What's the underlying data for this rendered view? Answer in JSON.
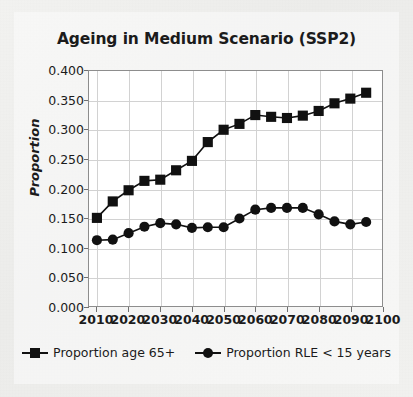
{
  "figure": {
    "title": "Ageing in Medium Scenario (SSP2)",
    "ylabel": "Proportion"
  },
  "legend": {
    "items": [
      {
        "label": "Proportion age 65+",
        "marker": "square-marker-icon",
        "color": "#111111"
      },
      {
        "label": "Proportion RLE < 15 years",
        "marker": "circle-marker-icon",
        "color": "#111111"
      }
    ]
  },
  "axes": {
    "yticks": [
      "0.400",
      "0.350",
      "0.300",
      "0.250",
      "0.200",
      "0.150",
      "0.100",
      "0.050",
      "0.000"
    ],
    "xticks": [
      "2010",
      "2020",
      "2030",
      "2040",
      "2050",
      "2060",
      "2070",
      "2080",
      "2090",
      "2100"
    ]
  },
  "chart_data": {
    "type": "line",
    "title": "Ageing in Medium Scenario (SSP2)",
    "xlabel": "",
    "ylabel": "Proportion",
    "xlim": [
      2007.5,
      2100
    ],
    "ylim": [
      0.0,
      0.4
    ],
    "ytick_values": [
      0.0,
      0.05,
      0.1,
      0.15,
      0.2,
      0.25,
      0.3,
      0.35,
      0.4
    ],
    "xtick_values": [
      2010,
      2020,
      2030,
      2040,
      2050,
      2060,
      2070,
      2080,
      2090,
      2100
    ],
    "grid": true,
    "legend_position": "bottom",
    "x": [
      2010,
      2015,
      2020,
      2025,
      2030,
      2035,
      2040,
      2045,
      2050,
      2055,
      2060,
      2065,
      2070,
      2075,
      2080,
      2085,
      2090,
      2095
    ],
    "series": [
      {
        "name": "Proportion age 65+",
        "marker": "square",
        "color": "#111111",
        "values": [
          0.15,
          0.178,
          0.197,
          0.213,
          0.215,
          0.231,
          0.247,
          0.279,
          0.3,
          0.31,
          0.325,
          0.322,
          0.32,
          0.324,
          0.332,
          0.345,
          0.353,
          0.363
        ]
      },
      {
        "name": "Proportion RLE < 15 years",
        "marker": "circle",
        "color": "#111111",
        "values": [
          0.112,
          0.113,
          0.124,
          0.135,
          0.141,
          0.139,
          0.133,
          0.134,
          0.134,
          0.149,
          0.164,
          0.167,
          0.167,
          0.167,
          0.156,
          0.144,
          0.139,
          0.143
        ]
      }
    ]
  }
}
